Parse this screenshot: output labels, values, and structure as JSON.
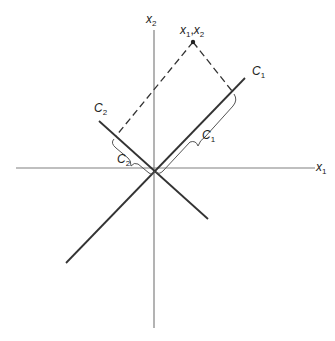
{
  "diagram": {
    "axes": {
      "x_label": "x",
      "x_sub": "1",
      "y_label": "x",
      "y_sub": "2"
    },
    "point": {
      "label_a": "x",
      "label_a_sub": "1",
      "sep": ",",
      "label_b": "x",
      "label_b_sub": "2"
    },
    "line_c1": {
      "label": "C",
      "sub": "1"
    },
    "line_c2": {
      "label": "C",
      "sub": "2"
    },
    "projection_c1": {
      "label": "C",
      "sub": "1"
    },
    "projection_c2": {
      "label": "C",
      "sub": "2"
    },
    "colors": {
      "axis": "#777777",
      "line": "#333333",
      "dash": "#333333"
    }
  }
}
